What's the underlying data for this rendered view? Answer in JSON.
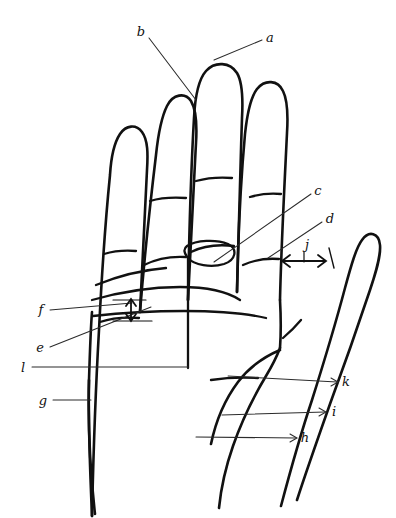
{
  "figure": {
    "background_color": "#ffffff",
    "ink_color": "#111111",
    "leader_line_color": "#2b2b2b",
    "style": "hand-drawn line sketch",
    "labels": [
      {
        "id": "a",
        "text": "a",
        "x": 270,
        "y": 38,
        "name": "label-a",
        "points_to": "middle fingertip / distal phalanx tip"
      },
      {
        "id": "b",
        "text": "b",
        "x": 141,
        "y": 32,
        "name": "label-b",
        "points_to": "middle finger distal interphalangeal area"
      },
      {
        "id": "c",
        "text": "c",
        "x": 318,
        "y": 191,
        "name": "label-c",
        "points_to": "base of middle finger / metacarpophalangeal crease"
      },
      {
        "id": "d",
        "text": "d",
        "x": 330,
        "y": 219,
        "name": "label-d",
        "points_to": "thenar web / radial palm margin"
      },
      {
        "id": "e",
        "text": "e",
        "x": 40,
        "y": 348,
        "name": "label-e",
        "points_to": "distal palmar crease"
      },
      {
        "id": "f",
        "text": "f",
        "x": 41,
        "y": 310,
        "name": "label-f",
        "points_to": "interval between palmar creases (vertical double arrow)"
      },
      {
        "id": "g",
        "text": "g",
        "x": 43,
        "y": 401,
        "name": "label-g",
        "points_to": "ulnar border of palm / hypothenar edge"
      },
      {
        "id": "h",
        "text": "h",
        "x": 305,
        "y": 438,
        "name": "label-h",
        "points_to": "wrist crease / proximal palm"
      },
      {
        "id": "i",
        "text": "i",
        "x": 334,
        "y": 412,
        "name": "label-i",
        "points_to": "thenar eminence"
      },
      {
        "id": "j",
        "text": "j",
        "x": 307,
        "y": 245,
        "name": "label-j",
        "points_to": "web space width (horizontal double arrow)"
      },
      {
        "id": "k",
        "text": "k",
        "x": 346,
        "y": 382,
        "name": "label-k",
        "points_to": "thumb metacarpophalangeal crease"
      },
      {
        "id": "l",
        "text": "l",
        "x": 23,
        "y": 368,
        "name": "label-l",
        "points_to": "proximal palmar crease"
      }
    ]
  }
}
